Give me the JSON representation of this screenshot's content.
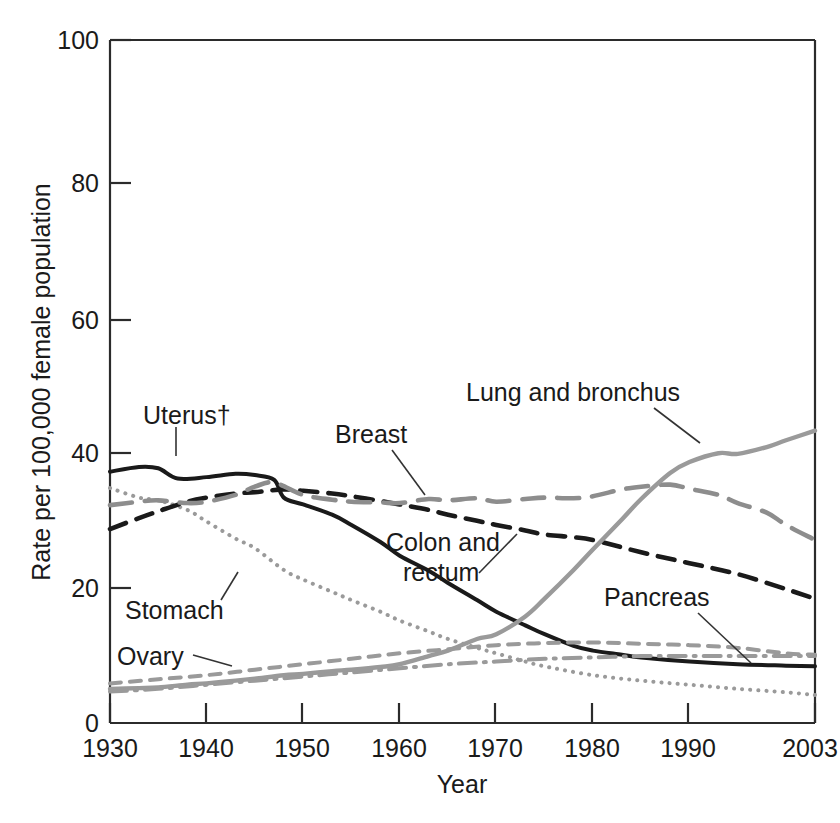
{
  "chart_data": {
    "type": "line",
    "title": "",
    "xlabel": "Year",
    "ylabel": "Rate per 100,000 female population",
    "xlim": [
      1930,
      2003
    ],
    "ylim": [
      0,
      100
    ],
    "grid": false,
    "legend_position": "inline-annotations",
    "xticks": [
      "1930",
      "1940",
      "1950",
      "1960",
      "1970",
      "1980",
      "1990",
      "2003"
    ],
    "xtick_values": [
      1930,
      1940,
      1950,
      1960,
      1970,
      1980,
      1990,
      2003
    ],
    "yticks": [
      "0",
      "20",
      "40",
      "60",
      "80",
      "100"
    ],
    "ytick_values": [
      0,
      20,
      40,
      60,
      80,
      100
    ],
    "series": [
      {
        "name": "Uterus†",
        "label": "Uterus†",
        "style": "solid",
        "color": "#1a1a1a",
        "width": 4.0,
        "x": [
          1930,
          1933,
          1935,
          1937,
          1940,
          1943,
          1945,
          1947,
          1948,
          1950,
          1953,
          1955,
          1958,
          1960,
          1963,
          1965,
          1968,
          1970,
          1973,
          1975,
          1978,
          1980,
          1983,
          1985,
          1990,
          1995,
          2000,
          2003
        ],
        "values": [
          36.8,
          37.5,
          37.3,
          35.8,
          36.0,
          36.5,
          36.3,
          35.6,
          33.0,
          32.0,
          30.5,
          29.0,
          26.5,
          24.5,
          22.3,
          20.5,
          18.0,
          16.3,
          14.3,
          13.0,
          11.3,
          10.6,
          10.0,
          9.6,
          9.0,
          8.6,
          8.4,
          8.3
        ]
      },
      {
        "name": "Stomach",
        "label": "Stomach",
        "style": "dotted",
        "color": "#9a9a9a",
        "width": 4.0,
        "x": [
          1930,
          1933,
          1935,
          1938,
          1940,
          1943,
          1945,
          1948,
          1950,
          1953,
          1955,
          1958,
          1960,
          1963,
          1965,
          1968,
          1970,
          1973,
          1975,
          1980,
          1985,
          1990,
          1995,
          2000,
          2003
        ],
        "values": [
          34.4,
          33.0,
          32.6,
          31.2,
          29.5,
          27.0,
          25.6,
          22.4,
          21.0,
          19.2,
          18.0,
          16.3,
          15.0,
          13.4,
          12.3,
          11.0,
          10.2,
          9.0,
          8.3,
          7.0,
          6.2,
          5.6,
          5.0,
          4.5,
          4.1
        ]
      },
      {
        "name": "Colon and rectum",
        "label": "Colon and rectum",
        "style": "dashed",
        "color": "#1a1a1a",
        "width": 4.6,
        "x": [
          1930,
          1933,
          1935,
          1938,
          1940,
          1943,
          1945,
          1948,
          1950,
          1953,
          1955,
          1958,
          1960,
          1963,
          1965,
          1968,
          1970,
          1973,
          1975,
          1978,
          1980,
          1985,
          1990,
          1995,
          2000,
          2003
        ],
        "values": [
          28.4,
          30.0,
          31.0,
          32.4,
          33.0,
          33.6,
          33.8,
          34.2,
          34.0,
          33.6,
          33.2,
          32.5,
          32.0,
          31.2,
          30.5,
          29.6,
          29.0,
          28.2,
          27.6,
          27.2,
          26.8,
          25.0,
          23.4,
          21.8,
          19.6,
          18.2
        ]
      },
      {
        "name": "Breast",
        "label": "Breast",
        "style": "longdash",
        "color": "#8d8d8d",
        "width": 4.6,
        "x": [
          1930,
          1933,
          1935,
          1938,
          1940,
          1943,
          1945,
          1947,
          1950,
          1953,
          1955,
          1958,
          1960,
          1963,
          1965,
          1968,
          1970,
          1973,
          1975,
          1978,
          1980,
          1983,
          1985,
          1988,
          1990,
          1993,
          1995,
          1998,
          2000,
          2003
        ],
        "values": [
          31.9,
          32.4,
          32.6,
          32.2,
          32.4,
          33.4,
          34.6,
          35.2,
          33.4,
          32.7,
          32.4,
          32.3,
          32.2,
          32.8,
          32.6,
          32.9,
          32.4,
          32.8,
          33.0,
          32.9,
          33.2,
          34.2,
          34.6,
          34.9,
          34.3,
          33.4,
          32.2,
          30.8,
          29.0,
          26.8
        ]
      },
      {
        "name": "Lung and bronchus",
        "label": "Lung and bronchus",
        "style": "solid",
        "color": "#9a9a9a",
        "width": 4.4,
        "x": [
          1930,
          1933,
          1935,
          1938,
          1940,
          1943,
          1945,
          1948,
          1950,
          1953,
          1955,
          1958,
          1960,
          1963,
          1965,
          1968,
          1970,
          1973,
          1975,
          1978,
          1980,
          1983,
          1985,
          1988,
          1990,
          1993,
          1995,
          1998,
          2000,
          2003
        ],
        "values": [
          5.0,
          5.1,
          5.2,
          5.6,
          5.8,
          6.2,
          6.5,
          7.0,
          7.2,
          7.6,
          7.8,
          8.2,
          8.6,
          9.8,
          10.6,
          12.3,
          13.0,
          15.6,
          18.2,
          22.4,
          25.4,
          29.8,
          32.8,
          36.6,
          38.2,
          39.5,
          39.4,
          40.4,
          41.4,
          42.8
        ]
      },
      {
        "name": "Ovary",
        "label": "Ovary",
        "style": "shortdash",
        "color": "#9a9a9a",
        "width": 4.0,
        "x": [
          1930,
          1935,
          1940,
          1945,
          1950,
          1955,
          1960,
          1965,
          1970,
          1975,
          1980,
          1985,
          1990,
          1995,
          2000,
          2003
        ],
        "values": [
          5.8,
          6.4,
          7.0,
          7.8,
          8.6,
          9.4,
          10.2,
          10.8,
          11.4,
          11.7,
          11.8,
          11.6,
          11.4,
          11.0,
          10.2,
          10.0
        ]
      },
      {
        "name": "Pancreas",
        "label": "Pancreas",
        "style": "dashdot",
        "color": "#9a9a9a",
        "width": 4.0,
        "x": [
          1930,
          1935,
          1940,
          1945,
          1950,
          1955,
          1960,
          1965,
          1970,
          1975,
          1980,
          1985,
          1990,
          1995,
          2000,
          2003
        ],
        "values": [
          4.6,
          5.0,
          5.6,
          6.2,
          6.8,
          7.4,
          8.0,
          8.6,
          9.0,
          9.4,
          9.6,
          9.8,
          9.8,
          9.8,
          9.8,
          9.8
        ]
      }
    ],
    "annotations": [
      {
        "text": "Uterus†",
        "anchor_x": 1930,
        "anchor_y": 36
      },
      {
        "text": "Stomach",
        "anchor_x": 1945,
        "anchor_y": 22
      },
      {
        "text": "Ovary",
        "anchor_x": 1938,
        "anchor_y": 11
      },
      {
        "text": "Breast",
        "anchor_x": 1962,
        "anchor_y": 33
      },
      {
        "text": "Colon and",
        "anchor_x": 1974,
        "anchor_y": 27
      },
      {
        "text": "rectum",
        "anchor_x": 1974,
        "anchor_y": 27
      },
      {
        "text": "Lung and bronchus",
        "anchor_x": 1988,
        "anchor_y": 40
      },
      {
        "text": "Pancreas",
        "anchor_x": 2000,
        "anchor_y": 10
      }
    ]
  },
  "labels": {
    "y_axis_title": "Rate per 100,000 female population",
    "x_axis_title": "Year",
    "uterus": "Uterus†",
    "stomach": "Stomach",
    "ovary": "Ovary",
    "breast": "Breast",
    "colon_line1": "Colon and",
    "colon_line2": "rectum",
    "lung": "Lung and bronchus",
    "pancreas": "Pancreas"
  },
  "ticks": {
    "y": [
      "100",
      "80",
      "60",
      "40",
      "20",
      "0"
    ],
    "x": [
      "1930",
      "1940",
      "1950",
      "1960",
      "1970",
      "1980",
      "1990",
      "2003"
    ]
  },
  "colors": {
    "axis": "#2b2b2b",
    "dark_series": "#1a1a1a",
    "gray_series": "#9a9a9a",
    "breast_gray": "#8d8d8d",
    "background": "#ffffff"
  }
}
